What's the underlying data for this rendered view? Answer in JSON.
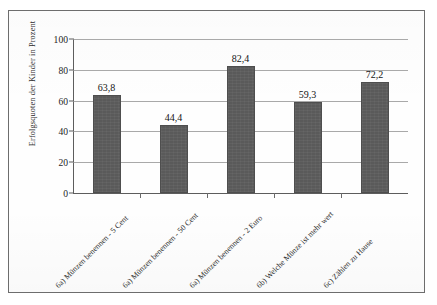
{
  "chart_data": {
    "type": "bar",
    "title": "",
    "subtitle": "",
    "xlabel": "",
    "ylabel": "Erfolgsquoten der Kinder in Prozent",
    "ylim": [
      0,
      100
    ],
    "yticks": [
      0,
      20,
      40,
      60,
      80,
      100
    ],
    "ytick_labels": [
      "0",
      "20",
      "40",
      "60",
      "80",
      "100"
    ],
    "grid": true,
    "legend": false,
    "legend_position": "none",
    "bar_color": "#5a5a5a",
    "decimal_separator": ",",
    "categories": [
      "6a) Münzen benennen - 5 Cent",
      "6a) Münzen benennen - 50 Cent",
      "6a) Münzen benennen - 2 Euro",
      "6b) Welche Münze ist mehr wert",
      "6c) Zählen zu Hause"
    ],
    "values": [
      63.8,
      44.4,
      82.4,
      59.3,
      72.2
    ],
    "data_labels": [
      "63,8",
      "44,4",
      "82,4",
      "59,3",
      "72,2"
    ]
  },
  "figure": {
    "frame_border_color": "#6d6d6d",
    "background_color": "#fefefe",
    "axis_color": "#5d5d5d",
    "gridline_color": "#a9a9a9"
  }
}
